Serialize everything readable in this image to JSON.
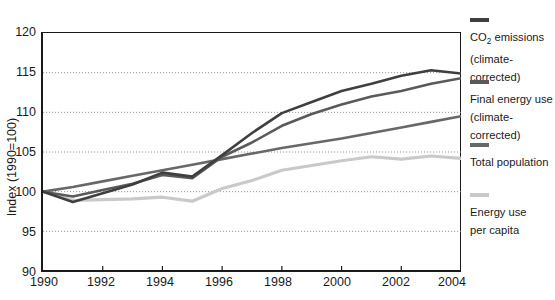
{
  "chart_data": {
    "type": "line",
    "title": "",
    "xlabel": "",
    "ylabel": "Index (1990=100)",
    "xlim": [
      1990,
      2004
    ],
    "ylim": [
      90,
      120
    ],
    "ytick_step": 5,
    "xtick_step": 2,
    "grid": "horizontal-dotted",
    "legend_position": "right",
    "x": [
      1990,
      1991,
      1992,
      1993,
      1994,
      1995,
      1996,
      1997,
      1998,
      1999,
      2000,
      2001,
      2002,
      2003,
      2004
    ],
    "series": [
      {
        "name": "CO2 emissions (climate-corrected)",
        "color": "#3f3f3f",
        "values": [
          100.0,
          98.7,
          99.8,
          100.9,
          102.4,
          101.9,
          104.6,
          107.4,
          109.9,
          111.3,
          112.7,
          113.6,
          114.6,
          115.3,
          114.9
        ]
      },
      {
        "name": "Final energy use (climate-corrected)",
        "color": "#5a5a5a",
        "values": [
          100.0,
          99.4,
          100.2,
          101.0,
          102.1,
          101.7,
          104.4,
          106.2,
          108.3,
          109.8,
          111.0,
          112.0,
          112.7,
          113.6,
          114.3
        ]
      },
      {
        "name": "Total population",
        "color": "#686868",
        "values": [
          100.0,
          100.6,
          101.3,
          102.0,
          102.7,
          103.4,
          104.1,
          104.8,
          105.5,
          106.1,
          106.7,
          107.4,
          108.1,
          108.8,
          109.5
        ]
      },
      {
        "name": "Energy use per capita",
        "color": "#c9c9c9",
        "values": [
          100.0,
          98.9,
          99.0,
          99.1,
          99.3,
          98.8,
          100.4,
          101.4,
          102.7,
          103.3,
          103.9,
          104.4,
          104.1,
          104.5,
          104.2
        ]
      }
    ],
    "yticks": [
      90,
      95,
      100,
      105,
      110,
      115,
      120
    ],
    "xticks": [
      1990,
      1992,
      1994,
      1996,
      1998,
      2000,
      2002,
      2004
    ]
  },
  "legend": {
    "items": [
      {
        "label": "CO₂ emissions\n(climate-corrected)",
        "label_main": "CO",
        "label_sub": "2",
        "label_rest": " emissions\n(climate-corrected)",
        "color": "#3f3f3f"
      },
      {
        "label": "Final energy use\n(climate-corrected)",
        "color": "#5a5a5a"
      },
      {
        "label": "Total population",
        "color": "#686868"
      },
      {
        "label": "Energy use\nper capita",
        "color": "#c9c9c9"
      }
    ]
  },
  "axis": {
    "y_title": "Index (1990=100)",
    "y_labels": [
      "120",
      "115",
      "110",
      "105",
      "100",
      "95",
      "90"
    ],
    "x_labels": [
      "1990",
      "1992",
      "1994",
      "1996",
      "1998",
      "2000",
      "2002",
      "2004"
    ]
  },
  "title_clipped": "Development of energy use, CO₂ emissions and population"
}
